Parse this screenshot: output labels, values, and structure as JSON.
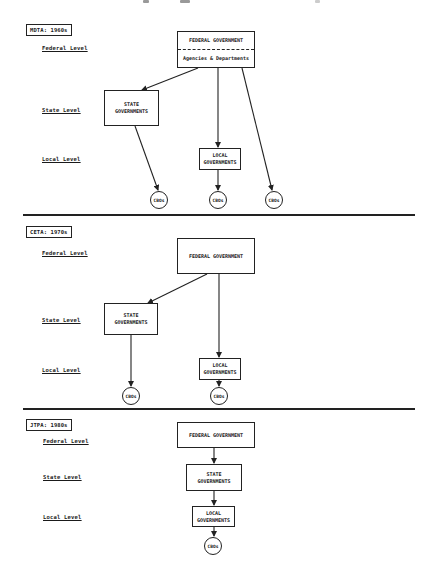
{
  "panels": [
    {
      "id": "mdta",
      "tag": "MDTA: 1960s",
      "levels": {
        "federal": "Federal Level",
        "state": "State Level",
        "local": "Local Level"
      },
      "federal_box": {
        "title": "FEDERAL GOVERNMENT",
        "subtitle": "Agencies & Departments"
      },
      "state_box": {
        "line1": "STATE",
        "line2": "GOVERNMENTS"
      },
      "local_box": {
        "line1": "LOCAL",
        "line2": "GOVERNMENTS"
      },
      "cbos": [
        "CBOs",
        "CBOs",
        "CBOs"
      ]
    },
    {
      "id": "ceta",
      "tag": "CETA: 1970s",
      "levels": {
        "federal": "Federal Level",
        "state": "State Level",
        "local": "Local Level"
      },
      "federal_box": {
        "title": "FEDERAL GOVERNMENT"
      },
      "state_box": {
        "line1": "STATE",
        "line2": "GOVERNMENTS"
      },
      "local_box": {
        "line1": "LOCAL",
        "line2": "GOVERNMENTS"
      },
      "cbos": [
        "CBOs",
        "CBOs"
      ]
    },
    {
      "id": "jtpa",
      "tag": "JTPA: 1980s",
      "levels": {
        "federal": "Federal Level",
        "state": "State Level",
        "local": "Local Level"
      },
      "federal_box": {
        "title": "FEDERAL GOVERNMENT"
      },
      "state_box": {
        "line1": "STATE",
        "line2": "GOVERNMENTS"
      },
      "local_box": {
        "line1": "LOCAL",
        "line2": "GOVERNMENTS"
      },
      "cbos": [
        "CBOs"
      ]
    }
  ],
  "edges": {
    "mdta": [
      "Federal -> State",
      "Federal -> Local",
      "Federal -> CBOs",
      "State -> CBOs",
      "Local -> CBOs"
    ],
    "ceta": [
      "Federal -> State",
      "Federal -> Local",
      "State -> CBOs",
      "Local -> CBOs"
    ],
    "jtpa": [
      "Federal -> State",
      "State -> Local",
      "Local -> CBOs"
    ]
  }
}
